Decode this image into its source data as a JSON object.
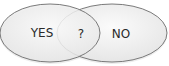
{
  "diagram": {
    "type": "venn",
    "left_set": {
      "label": "YES"
    },
    "right_set": {
      "label": "NO"
    },
    "intersection": {
      "label": "?"
    },
    "colors": {
      "stroke": "#7a7a7a",
      "fill": "#f1f1f1",
      "shadow": "#d8d8d8",
      "text": "#2a2a2a"
    }
  }
}
